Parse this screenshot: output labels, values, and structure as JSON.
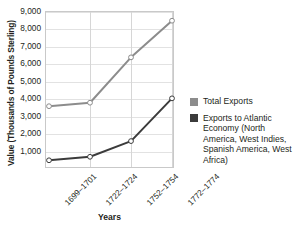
{
  "chart_data": {
    "type": "line",
    "title": "",
    "xlabel": "Years",
    "ylabel": "Value (Thousands of Pounds Sterling)",
    "categories": [
      "1699–1701",
      "1722–1724",
      "1752–1754",
      "1772–1774"
    ],
    "series": [
      {
        "name": "Total Exports",
        "color": "#8c8c8c",
        "marker": "open-circle",
        "values": [
          3600,
          3800,
          6400,
          8500
        ]
      },
      {
        "name": "Exports to Atlantic Economy (North America, West Indies, Spanish America, West Africa)",
        "color": "#3b3b3b",
        "marker": "open-circle",
        "values": [
          500,
          700,
          1600,
          4050
        ]
      }
    ],
    "ylim": [
      0,
      9000
    ],
    "yticks": [
      1000,
      2000,
      3000,
      4000,
      5000,
      6000,
      7000,
      8000,
      9000
    ],
    "ytick_labels": [
      "1,000",
      "2,000",
      "3,000",
      "4,000",
      "5,000",
      "6,000",
      "7,000",
      "8,000",
      "9,000"
    ],
    "grid": true,
    "legend_position": "right"
  },
  "legend": {
    "items": [
      {
        "label": "Total Exports",
        "color": "#8c8c8c"
      },
      {
        "label": "Exports to Atlantic Economy (North America, West Indies, Spanish America, West Africa)",
        "color": "#3b3b3b"
      }
    ]
  },
  "colors": {
    "total_exports": "#8c8c8c",
    "atlantic_exports": "#3b3b3b",
    "grid": "#e2e2e2",
    "frame": "#c9c9c9",
    "text": "#231f20",
    "background": "#ffffff"
  }
}
